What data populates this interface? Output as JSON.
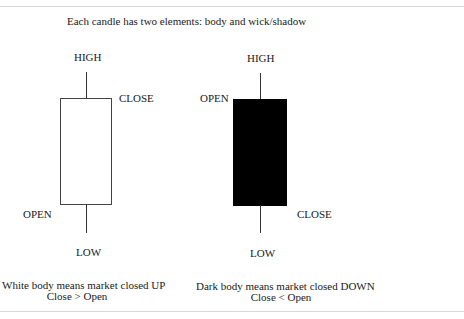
{
  "title": "Each candle has two elements: body and wick/shadow",
  "candles": {
    "bullish": {
      "body": "white",
      "labels": {
        "high": "HIGH",
        "close": "CLOSE",
        "open": "OPEN",
        "low": "LOW"
      },
      "caption_line1": "White body means market closed UP",
      "caption_line2": "Close > Open"
    },
    "bearish": {
      "body": "dark",
      "labels": {
        "high": "HIGH",
        "open": "OPEN",
        "close": "CLOSE",
        "low": "LOW"
      },
      "caption_line1": "Dark body means market closed DOWN",
      "caption_line2": "Close < Open"
    }
  },
  "colors": {
    "white_body": "#ffffff",
    "dark_body": "#000000",
    "outline": "#444444",
    "rule": "#d8d8d8"
  }
}
